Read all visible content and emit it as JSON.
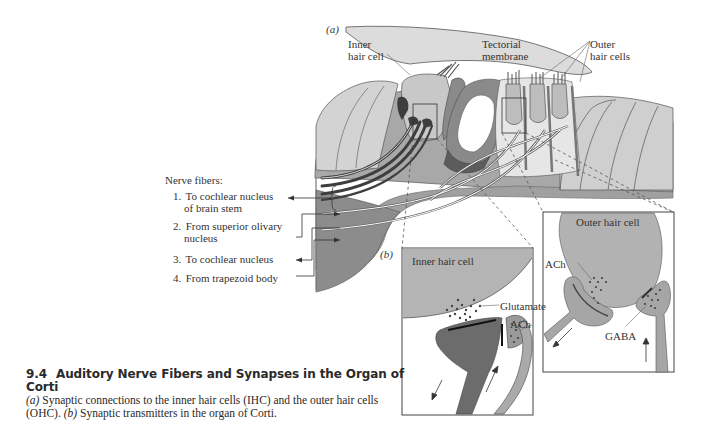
{
  "figure": {
    "number": "9.4",
    "title": "Auditory Nerve Fibers and Synapses in the Organ of Corti",
    "caption_parts": [
      {
        "italic": true,
        "text": "(a)"
      },
      {
        "italic": false,
        "text": " Synaptic connections to the inner hair cells (IHC) and the outer hair cells (OHC). "
      },
      {
        "italic": true,
        "text": "(b)"
      },
      {
        "italic": false,
        "text": " Synaptic transmitters in the organ of Corti."
      }
    ]
  },
  "panel_a": {
    "tag": "(a)",
    "labels": {
      "inner_hair_cell_line1": "Inner",
      "inner_hair_cell_line2": "hair cell",
      "tectorial_line1": "Tectorial",
      "tectorial_line2": "membrane",
      "outer_hair_cells_line1": "Outer",
      "outer_hair_cells_line2": "hair cells"
    },
    "nerve_fibers": {
      "title": "Nerve fibers:",
      "items": [
        {
          "num": "1.",
          "line1": "To cochlear nucleus",
          "line2": "of brain stem"
        },
        {
          "num": "2.",
          "line1": "From superior olivary",
          "line2": "nucleus"
        },
        {
          "num": "3.",
          "line1": "To cochlear nucleus",
          "line2": ""
        },
        {
          "num": "4.",
          "line1": "From trapezoid body",
          "line2": ""
        }
      ]
    }
  },
  "panel_b": {
    "tag": "(b)",
    "inner_box": {
      "title": "Inner hair cell",
      "glutamate": "Glutamate",
      "ach": "ACh"
    },
    "outer_box": {
      "title": "Outer hair cell",
      "ach": "ACh",
      "gaba": "GABA"
    }
  },
  "colors": {
    "light_gray": "#d8d8d8",
    "mid_gray": "#a8a8a8",
    "dark_gray": "#6e6e6e",
    "darkest": "#4a4a4a",
    "outline": "#555555"
  }
}
